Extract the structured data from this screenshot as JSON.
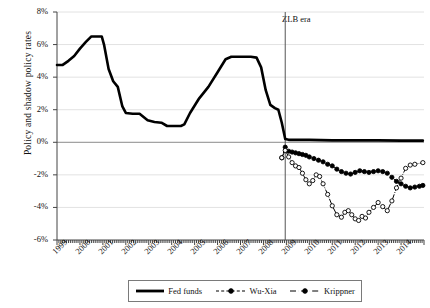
{
  "chart_data": {
    "type": "line",
    "title": "",
    "xlabel": "",
    "ylabel": "Policy and shadow policy rates",
    "ylim": [
      -6,
      8
    ],
    "xlim": [
      1999.0,
      2015.0
    ],
    "grid": true,
    "legend_position": "bottom",
    "ytick_labels": [
      "8%",
      "6%",
      "4%",
      "2%",
      "0%",
      "-2%",
      "-4%",
      "-6%"
    ],
    "ytick_values": [
      8,
      6,
      4,
      2,
      0,
      -2,
      -4,
      -6
    ],
    "xtick_labels": [
      "1999",
      "2000",
      "2001",
      "2002",
      "2003",
      "2004",
      "2005",
      "2006",
      "2007",
      "2008",
      "2009",
      "2010",
      "2011",
      "2012",
      "2013",
      "2014"
    ],
    "xtick_values": [
      1999,
      2000,
      2001,
      2002,
      2003,
      2004,
      2005,
      2006,
      2007,
      2008,
      2009,
      2010,
      2011,
      2012,
      2013,
      2014
    ],
    "annotations": [
      {
        "text": "ZLB era",
        "x": 2008.95,
        "kind": "vertical-line-label"
      }
    ],
    "series": [
      {
        "name": "Fed funds",
        "style": "solid",
        "marker": "none",
        "color": "#000000",
        "width": 2.6,
        "points": [
          [
            1999.0,
            4.75
          ],
          [
            1999.25,
            4.75
          ],
          [
            1999.5,
            5.0
          ],
          [
            1999.75,
            5.3
          ],
          [
            2000.0,
            5.75
          ],
          [
            2000.25,
            6.15
          ],
          [
            2000.5,
            6.5
          ],
          [
            2000.75,
            6.5
          ],
          [
            2000.95,
            6.5
          ],
          [
            2001.05,
            6.0
          ],
          [
            2001.25,
            4.5
          ],
          [
            2001.45,
            3.75
          ],
          [
            2001.65,
            3.4
          ],
          [
            2001.85,
            2.2
          ],
          [
            2002.0,
            1.8
          ],
          [
            2002.3,
            1.75
          ],
          [
            2002.6,
            1.75
          ],
          [
            2002.95,
            1.35
          ],
          [
            2003.25,
            1.25
          ],
          [
            2003.55,
            1.2
          ],
          [
            2003.8,
            1.0
          ],
          [
            2004.0,
            1.0
          ],
          [
            2004.4,
            1.0
          ],
          [
            2004.55,
            1.1
          ],
          [
            2004.8,
            1.8
          ],
          [
            2005.2,
            2.7
          ],
          [
            2005.6,
            3.4
          ],
          [
            2006.0,
            4.3
          ],
          [
            2006.35,
            5.1
          ],
          [
            2006.6,
            5.25
          ],
          [
            2007.0,
            5.25
          ],
          [
            2007.45,
            5.25
          ],
          [
            2007.7,
            5.2
          ],
          [
            2007.9,
            4.6
          ],
          [
            2008.1,
            3.2
          ],
          [
            2008.3,
            2.3
          ],
          [
            2008.5,
            2.1
          ],
          [
            2008.65,
            2.0
          ],
          [
            2008.8,
            1.2
          ],
          [
            2008.95,
            0.2
          ],
          [
            2009.1,
            0.15
          ],
          [
            2009.4,
            0.15
          ],
          [
            2010.0,
            0.15
          ],
          [
            2011.0,
            0.12
          ],
          [
            2012.0,
            0.12
          ],
          [
            2013.0,
            0.12
          ],
          [
            2014.0,
            0.1
          ],
          [
            2014.95,
            0.1
          ]
        ]
      },
      {
        "name": "Wu-Xia",
        "style": "dashed",
        "marker": "filled-circle",
        "color": "#000000",
        "width": 1.0,
        "points": [
          [
            2008.8,
            -0.95
          ],
          [
            2008.95,
            -0.3
          ],
          [
            2009.1,
            -0.55
          ],
          [
            2009.25,
            -0.6
          ],
          [
            2009.4,
            -0.65
          ],
          [
            2009.55,
            -0.7
          ],
          [
            2009.7,
            -0.75
          ],
          [
            2009.85,
            -0.8
          ],
          [
            2010.0,
            -0.9
          ],
          [
            2010.2,
            -1.0
          ],
          [
            2010.4,
            -1.1
          ],
          [
            2010.6,
            -1.2
          ],
          [
            2010.8,
            -1.35
          ],
          [
            2011.0,
            -1.45
          ],
          [
            2011.2,
            -1.65
          ],
          [
            2011.4,
            -1.8
          ],
          [
            2011.6,
            -1.9
          ],
          [
            2011.8,
            -1.95
          ],
          [
            2012.0,
            -1.85
          ],
          [
            2012.2,
            -1.75
          ],
          [
            2012.4,
            -1.8
          ],
          [
            2012.6,
            -1.85
          ],
          [
            2012.8,
            -1.8
          ],
          [
            2013.0,
            -1.75
          ],
          [
            2013.2,
            -1.8
          ],
          [
            2013.4,
            -1.9
          ],
          [
            2013.6,
            -2.15
          ],
          [
            2013.8,
            -2.4
          ],
          [
            2014.0,
            -2.55
          ],
          [
            2014.2,
            -2.7
          ],
          [
            2014.4,
            -2.8
          ],
          [
            2014.6,
            -2.75
          ],
          [
            2014.8,
            -2.7
          ],
          [
            2014.95,
            -2.65
          ]
        ]
      },
      {
        "name": "Krippner",
        "style": "dash-dot",
        "marker": "open-circle",
        "color": "#000000",
        "width": 1.0,
        "points": [
          [
            2008.8,
            -0.95
          ],
          [
            2008.95,
            -0.5
          ],
          [
            2009.1,
            -0.9
          ],
          [
            2009.25,
            -1.25
          ],
          [
            2009.4,
            -1.45
          ],
          [
            2009.55,
            -1.55
          ],
          [
            2009.7,
            -1.9
          ],
          [
            2009.85,
            -2.3
          ],
          [
            2010.0,
            -2.55
          ],
          [
            2010.15,
            -2.35
          ],
          [
            2010.3,
            -2.0
          ],
          [
            2010.45,
            -2.1
          ],
          [
            2010.6,
            -2.55
          ],
          [
            2010.8,
            -3.2
          ],
          [
            2011.0,
            -3.9
          ],
          [
            2011.2,
            -4.45
          ],
          [
            2011.4,
            -4.6
          ],
          [
            2011.55,
            -4.3
          ],
          [
            2011.7,
            -4.2
          ],
          [
            2011.85,
            -4.45
          ],
          [
            2012.0,
            -4.7
          ],
          [
            2012.15,
            -4.8
          ],
          [
            2012.3,
            -4.55
          ],
          [
            2012.45,
            -4.65
          ],
          [
            2012.6,
            -4.3
          ],
          [
            2012.8,
            -4.0
          ],
          [
            2013.0,
            -3.7
          ],
          [
            2013.2,
            -3.95
          ],
          [
            2013.4,
            -4.2
          ],
          [
            2013.6,
            -3.6
          ],
          [
            2013.8,
            -2.8
          ],
          [
            2014.0,
            -2.2
          ],
          [
            2014.2,
            -1.6
          ],
          [
            2014.4,
            -1.4
          ],
          [
            2014.6,
            -1.35
          ],
          [
            2014.95,
            -1.25
          ]
        ]
      }
    ]
  },
  "legend": {
    "items": [
      {
        "label": "Fed funds"
      },
      {
        "label": "Wu-Xia"
      },
      {
        "label": "Krippner"
      }
    ]
  }
}
